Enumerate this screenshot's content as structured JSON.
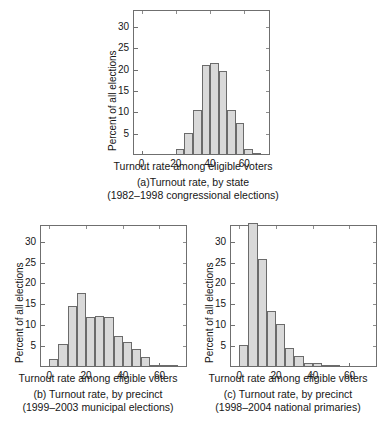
{
  "figure": {
    "axis_label_x": "Turnout rate among eligible voters",
    "axis_label_y": "Percent of all elections"
  },
  "panels": [
    {
      "id": "a",
      "caption_line1": "(a)Turnout rate, by state",
      "caption_line2": "(1982–1998 congressional elections)",
      "chart_data": {
        "type": "bar",
        "title": "(a)Turnout rate, by state (1982–1998 congressional elections)",
        "xlabel": "Turnout rate among eligible voters",
        "ylabel": "Percent of all elections",
        "xlim": [
          -5,
          75
        ],
        "ylim": [
          0,
          34
        ],
        "xticks": [
          0,
          20,
          40,
          60
        ],
        "yticks": [
          5,
          10,
          15,
          20,
          25,
          30
        ],
        "grid": false,
        "legend": null,
        "bin_width": 5,
        "bin_starts": [
          20,
          25,
          30,
          35,
          40,
          45,
          50,
          55,
          60,
          65
        ],
        "categories": [
          "20–25",
          "25–30",
          "30–35",
          "35–40",
          "40–45",
          "45–50",
          "50–55",
          "55–60",
          "60–65",
          "65–70"
        ],
        "values": [
          1.3,
          5.1,
          10.5,
          21.2,
          21.5,
          19.6,
          10.5,
          7.4,
          1.4,
          0.3
        ]
      }
    },
    {
      "id": "b",
      "caption_line1": "(b) Turnout rate, by precinct",
      "caption_line2": "(1999–2003 municipal elections)",
      "chart_data": {
        "type": "bar",
        "title": "(b) Turnout rate, by precinct (1999–2003 municipal elections)",
        "xlabel": "Turnout rate among eligible voters",
        "ylabel": "Percent of all elections",
        "xlim": [
          -5,
          75
        ],
        "ylim": [
          0,
          34
        ],
        "xticks": [
          0,
          20,
          40,
          60
        ],
        "yticks": [
          5,
          10,
          15,
          20,
          25,
          30
        ],
        "grid": false,
        "legend": null,
        "bin_width": 5,
        "bin_starts": [
          0,
          5,
          10,
          15,
          20,
          25,
          30,
          35,
          40,
          45,
          50,
          55,
          60,
          65
        ],
        "categories": [
          "0–5",
          "5–10",
          "10–15",
          "15–20",
          "20–25",
          "25–30",
          "30–35",
          "35–40",
          "40–45",
          "45–50",
          "50–55",
          "55–60",
          "60–65",
          "65–70"
        ],
        "values": [
          1.8,
          5.5,
          14.7,
          17.8,
          12.0,
          12.3,
          12.0,
          7.4,
          6.0,
          4.2,
          2.3,
          0.4,
          0.3,
          0.2
        ]
      }
    },
    {
      "id": "c",
      "caption_line1": "(c) Turnout rate, by precinct",
      "caption_line2": "(1998–2004 national primaries)",
      "chart_data": {
        "type": "bar",
        "title": "(c) Turnout rate, by precinct (1998–2004 national primaries)",
        "xlabel": "Turnout rate among eligible voters",
        "ylabel": "Percent of all elections",
        "xlim": [
          -5,
          75
        ],
        "ylim": [
          0,
          34
        ],
        "xticks": [
          0,
          20,
          40,
          60
        ],
        "yticks": [
          5,
          10,
          15,
          20,
          25,
          30
        ],
        "grid": false,
        "legend": null,
        "bin_width": 5,
        "bin_starts": [
          0,
          5,
          10,
          15,
          20,
          25,
          30,
          35,
          40,
          45,
          50
        ],
        "categories": [
          "0–5",
          "5–10",
          "10–15",
          "15–20",
          "20–25",
          "25–30",
          "30–35",
          "35–40",
          "40–45",
          "45–50",
          "50–55"
        ],
        "values": [
          5.2,
          34.5,
          25.9,
          13.5,
          10.4,
          4.5,
          2.6,
          1.0,
          0.9,
          0.2,
          0.15
        ]
      }
    }
  ],
  "chart_data": [
    {
      "type": "bar",
      "title": "(a)Turnout rate, by state (1982–1998 congressional elections)",
      "xlabel": "Turnout rate among eligible voters",
      "ylabel": "Percent of all elections",
      "xlim": [
        -5,
        75
      ],
      "ylim": [
        0,
        34
      ],
      "xticks": [
        0,
        20,
        40,
        60
      ],
      "yticks": [
        5,
        10,
        15,
        20,
        25,
        30
      ],
      "grid": false,
      "categories": [
        "20–25",
        "25–30",
        "30–35",
        "35–40",
        "40–45",
        "45–50",
        "50–55",
        "55–60",
        "60–65",
        "65–70"
      ],
      "values": [
        1.3,
        5.1,
        10.5,
        21.2,
        21.5,
        19.6,
        10.5,
        7.4,
        1.4,
        0.3
      ]
    },
    {
      "type": "bar",
      "title": "(b) Turnout rate, by precinct (1999–2003 municipal elections)",
      "xlabel": "Turnout rate among eligible voters",
      "ylabel": "Percent of all elections",
      "xlim": [
        -5,
        75
      ],
      "ylim": [
        0,
        34
      ],
      "xticks": [
        0,
        20,
        40,
        60
      ],
      "yticks": [
        5,
        10,
        15,
        20,
        25,
        30
      ],
      "grid": false,
      "categories": [
        "0–5",
        "5–10",
        "10–15",
        "15–20",
        "20–25",
        "25–30",
        "30–35",
        "35–40",
        "40–45",
        "45–50",
        "50–55",
        "55–60",
        "60–65",
        "65–70"
      ],
      "values": [
        1.8,
        5.5,
        14.7,
        17.8,
        12.0,
        12.3,
        12.0,
        7.4,
        6.0,
        4.2,
        2.3,
        0.4,
        0.3,
        0.2
      ]
    },
    {
      "type": "bar",
      "title": "(c) Turnout rate, by precinct (1998–2004 national primaries)",
      "xlabel": "Turnout rate among eligible voters",
      "ylabel": "Percent of all elections",
      "xlim": [
        -5,
        75
      ],
      "ylim": [
        0,
        34
      ],
      "xticks": [
        0,
        20,
        40,
        60
      ],
      "yticks": [
        5,
        10,
        15,
        20,
        25,
        30
      ],
      "grid": false,
      "categories": [
        "0–5",
        "5–10",
        "10–15",
        "15–20",
        "20–25",
        "25–30",
        "30–35",
        "35–40",
        "40–45",
        "45–50",
        "50–55"
      ],
      "values": [
        5.2,
        34.5,
        25.9,
        13.5,
        10.4,
        4.5,
        2.6,
        1.0,
        0.9,
        0.2,
        0.15
      ]
    }
  ]
}
